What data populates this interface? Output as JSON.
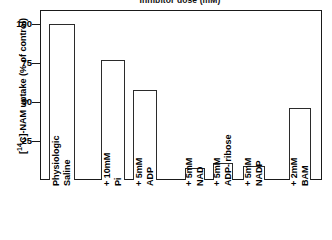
{
  "chart_data": {
    "type": "bar",
    "title": "Inhibitor dose (mM)",
    "xlabel": "",
    "ylabel": "[14C]-NAM uptake (% of control)",
    "ylabel_prefix": "[",
    "ylabel_sup": "14",
    "ylabel_rest": "C]-NAM uptake (% of control)",
    "ylim": [
      0,
      112
    ],
    "yticks": [
      25,
      50,
      75,
      100
    ],
    "ytick_labels": [
      "25",
      "50",
      "75",
      "100"
    ],
    "grid": false,
    "legend": false,
    "bar_style": "open-outline",
    "categories": [
      "Physiologic Saline",
      "+ 10mM Pi",
      "+ 5mM ADP",
      "+ 5mM NAD",
      "+ 5mM ADP-ribose",
      "+ 5mM NADP",
      "+ 2mM BAM"
    ],
    "category_lines": [
      {
        "line1": "Physiologic",
        "line2": "Saline"
      },
      {
        "line1": "+ 10mM",
        "line2": "Pi"
      },
      {
        "line1": "+ 5mM",
        "line2": "ADP"
      },
      {
        "line1": "+ 5mM",
        "line2": "NAD"
      },
      {
        "line1": "+ 5mM",
        "line2": "ADP- ribose"
      },
      {
        "line1": "+ 5mM",
        "line2": "NADP"
      },
      {
        "line1": "+ 2mM",
        "line2": "BAM"
      }
    ],
    "values": [
      100,
      77,
      58,
      8,
      11,
      9,
      46
    ],
    "colors": {
      "bar_fill": "#ffffff",
      "bar_outline": "#2b2b2b",
      "axis": "#1a1a1a",
      "text": "#000000",
      "background": "#ffffff"
    }
  }
}
